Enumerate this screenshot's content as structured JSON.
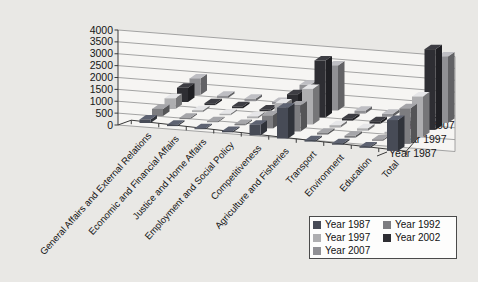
{
  "page": {
    "background": "#e9e8e5"
  },
  "chart_data": {
    "type": "bar3d",
    "title": "",
    "categories": [
      "General Affairs and External Relations",
      "Economic and Financial Affairs",
      "Justice and Home Affairs",
      "Employment and Social Policy",
      "Competitiveness",
      "Agriculture and Fisheries",
      "Transport",
      "Environment",
      "Education",
      "Total"
    ],
    "series": [
      {
        "name": "Year 1987",
        "color": "#474b56",
        "values": [
          150,
          60,
          0,
          60,
          450,
          1300,
          60,
          60,
          60,
          1300
        ]
      },
      {
        "name": "Year 1992",
        "color": "#7d7d80",
        "values": [
          300,
          60,
          30,
          60,
          550,
          1100,
          80,
          80,
          60,
          1500
        ]
      },
      {
        "name": "Year 1997",
        "color": "#aeaeb0",
        "values": [
          450,
          80,
          60,
          80,
          750,
          1500,
          100,
          100,
          80,
          1700
        ]
      },
      {
        "name": "Year 2002",
        "color": "#2e2e33",
        "values": [
          600,
          80,
          80,
          80,
          850,
          2400,
          100,
          100,
          80,
          3400
        ]
      },
      {
        "name": "Year 2007",
        "color": "#909094",
        "values": [
          700,
          100,
          100,
          100,
          950,
          1900,
          120,
          120,
          100,
          2800
        ]
      }
    ],
    "depth_axis_labels": [
      "Year 1987",
      "Year 1997",
      "Year 2007"
    ],
    "ylim": [
      0,
      4000
    ],
    "ytick_step": 500,
    "ytick_labels": [
      "0",
      "500",
      "1000",
      "1500",
      "2000",
      "2500",
      "3000",
      "3500",
      "4000"
    ],
    "grid": "on",
    "legend_position": "bottom-right",
    "legend_items": [
      "Year 1987",
      "Year 1992",
      "Year 1997",
      "Year 2002",
      "Year 2007"
    ]
  },
  "colors": {
    "paper": "#e9e8e5",
    "wall": "#f6f5f3",
    "gridline": "#9a9a9a",
    "axis": "#3a3a3a",
    "text": "#161616",
    "legend_bg": "#fdfdfc",
    "legend_border": "#4a4a4a"
  }
}
